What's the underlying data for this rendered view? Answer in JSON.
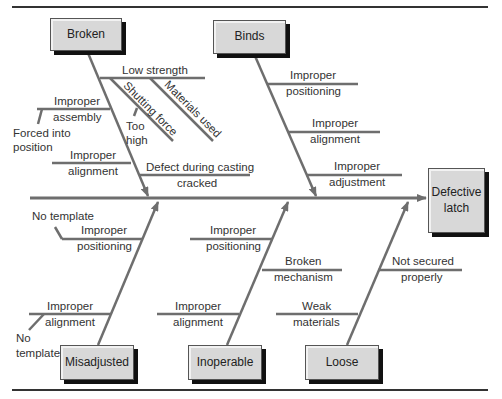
{
  "effect": "Defective latch",
  "categories": {
    "broken": {
      "label": "Broken",
      "causes": {
        "low_strength": "Low strength",
        "materials_used": "Materials used",
        "shutting_force": "Shutting force",
        "too_high": "Too high",
        "improper_assembly_1": "Improper",
        "improper_assembly_2": "assembly",
        "forced_into_position": "Forced into position",
        "improper_alignment_1": "Improper",
        "improper_alignment_2": "alignment",
        "defect_during_casting": "Defect during casting",
        "cracked": "cracked"
      }
    },
    "binds": {
      "label": "Binds",
      "causes": {
        "positioning_1": "Improper",
        "positioning_2": "positioning",
        "alignment_1": "Improper",
        "alignment_2": "alignment",
        "adjustment_1": "Improper",
        "adjustment_2": "adjustment"
      }
    },
    "misadjusted": {
      "label": "Misadjusted",
      "causes": {
        "no_template_top": "No template",
        "positioning_1": "Improper",
        "positioning_2": "positioning",
        "alignment_1": "Improper",
        "alignment_2": "alignment",
        "no_template_bottom_1": "No",
        "no_template_bottom_2": "template"
      }
    },
    "inoperable": {
      "label": "Inoperable",
      "causes": {
        "positioning_1": "Improper",
        "positioning_2": "positioning",
        "broken_1": "Broken",
        "broken_2": "mechanism",
        "alignment_1": "Improper",
        "alignment_2": "alignment"
      }
    },
    "loose": {
      "label": "Loose",
      "causes": {
        "not_secured_1": "Not secured",
        "not_secured_2": "properly",
        "weak_1": "Weak",
        "weak_2": "materials"
      }
    }
  },
  "colors": {
    "line": "#6e6e6e",
    "box_fill": "#d8d8d8",
    "frame": "#333333"
  }
}
